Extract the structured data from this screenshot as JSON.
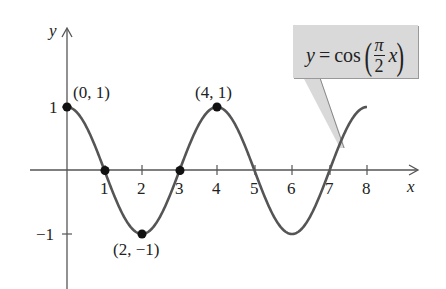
{
  "chart_data": {
    "type": "line",
    "title": "",
    "function_label": {
      "lhs": "y",
      "eq": "=",
      "func": "cos",
      "frac_num": "π",
      "frac_den": "2",
      "var": "x"
    },
    "xlabel": "x",
    "ylabel": "y",
    "x_ticks": [
      "1",
      "2",
      "3",
      "4",
      "5",
      "6",
      "7",
      "8"
    ],
    "y_ticks": [
      "1",
      "−1"
    ],
    "xlim": [
      -1,
      9
    ],
    "ylim": [
      -1.8,
      1.5
    ],
    "grid": false,
    "series": [
      {
        "name": "y = cos(πx/2)",
        "x": [
          0,
          1,
          2,
          3,
          4,
          5,
          6,
          7,
          8
        ],
        "y": [
          1,
          0,
          -1,
          0,
          1,
          0,
          -1,
          0,
          1
        ]
      }
    ],
    "marked_points": [
      {
        "x": 0,
        "y": 1,
        "label": "(0, 1)"
      },
      {
        "x": 1,
        "y": 0,
        "label": ""
      },
      {
        "x": 2,
        "y": -1,
        "label": "(2, −1)"
      },
      {
        "x": 3,
        "y": 0,
        "label": ""
      },
      {
        "x": 4,
        "y": 1,
        "label": "(4, 1)"
      }
    ],
    "colors": {
      "curve": "#555555",
      "axes": "#555555",
      "points": "#111111",
      "callout_bg": "#d9d9d9"
    }
  }
}
